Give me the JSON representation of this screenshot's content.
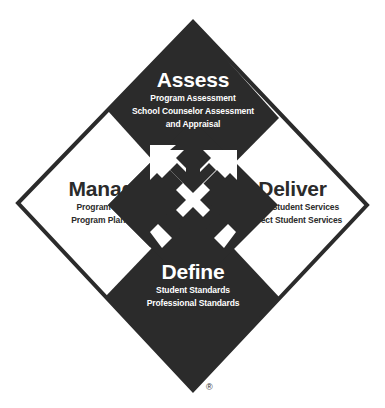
{
  "colors": {
    "dark": "#2b2b2b",
    "light": "#ffffff"
  },
  "quadrants": {
    "assess": {
      "title": "Assess",
      "items": [
        "Program Assessment",
        "School Counselor Assessment",
        "and Appraisal"
      ]
    },
    "manage": {
      "title": "Manage",
      "items": [
        "Program Focus",
        "Program Planning"
      ]
    },
    "deliver": {
      "title": "Deliver",
      "items": [
        "Direct Student Services",
        "Indirect Student Services"
      ]
    },
    "define": {
      "title": "Define",
      "items": [
        "Student Standards",
        "Professional Standards"
      ]
    }
  },
  "center_arrows": [
    "up-left",
    "up-right",
    "down-left",
    "down-right"
  ],
  "registered_mark": "®"
}
